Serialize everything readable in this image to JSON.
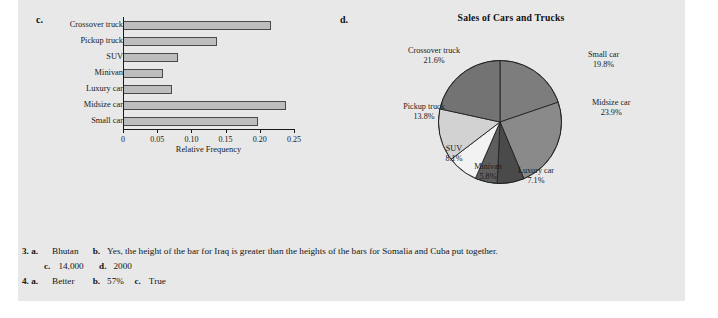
{
  "panel": {
    "background": "#e8e8e8"
  },
  "part_c": {
    "letter": "c.",
    "chart_data": {
      "type": "bar",
      "orientation": "horizontal",
      "title": "",
      "xlabel": "Relative Frequency",
      "ylabel": "",
      "xlim": [
        0,
        0.25
      ],
      "grid": false,
      "categories": [
        "Crossover truck",
        "Pickup truck",
        "SUV",
        "Minivan",
        "Luxury car",
        "Midsize car",
        "Small car"
      ],
      "values": [
        0.216,
        0.138,
        0.081,
        0.058,
        0.071,
        0.239,
        0.198
      ],
      "tick_labels": [
        "0",
        "0.05",
        "0.10",
        "0.15",
        "0.20",
        "0.25"
      ],
      "tick_values": [
        0,
        0.05,
        0.1,
        0.15,
        0.2,
        0.25
      ],
      "bar_fill": "#bdbdbd",
      "bar_stroke": "#4a4a4a"
    }
  },
  "part_d": {
    "letter": "d.",
    "chart_data": {
      "type": "pie",
      "title": "Sales of Cars and Trucks",
      "legend_position": "none",
      "labels": [
        "Small car",
        "Midsize car",
        "Luxury car",
        "Minivan",
        "SUV",
        "Pickup truck",
        "Crossover truck"
      ],
      "values": [
        19.8,
        23.9,
        7.1,
        5.8,
        8.1,
        13.8,
        21.6
      ],
      "value_labels": [
        "19.8%",
        "23.9%",
        "7.1%",
        "5.8%",
        "8.1%",
        "13.8%",
        "21.6%"
      ],
      "colors": [
        "#7d7d7d",
        "#8a8a8a",
        "#4a4a4a",
        "#5e5e5e",
        "#f2f2f2",
        "#d2d2d2",
        "#737373"
      ]
    }
  },
  "answers": {
    "rows": [
      {
        "items": [
          {
            "num": "3. a.",
            "text": "Bhutan"
          },
          {
            "num": "b.",
            "text": "Yes, the height of the bar for Iraq is greater than the heights of the bars for Somalia and Cuba put together."
          }
        ]
      },
      {
        "items": [
          {
            "num": "c.",
            "text": "14,000"
          },
          {
            "num": "d.",
            "text": "2000"
          }
        ]
      },
      {
        "items": [
          {
            "num": "4. a.",
            "text": "Better"
          },
          {
            "num": "b.",
            "text": "57%"
          },
          {
            "num": "c.",
            "text": "True"
          }
        ]
      }
    ]
  }
}
